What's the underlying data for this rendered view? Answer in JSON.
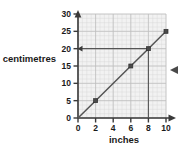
{
  "chart_data": {
    "type": "line",
    "title": "",
    "subtitle": "",
    "xlabel": "inches",
    "ylabel": "centimetres",
    "xlim": [
      0,
      10
    ],
    "ylim": [
      0,
      30
    ],
    "x_ticks": [
      0,
      2,
      4,
      6,
      8,
      10
    ],
    "y_ticks": [
      0,
      5,
      10,
      15,
      20,
      25,
      30
    ],
    "x_tick_labels": [
      "0",
      "2",
      "4",
      "6",
      "8",
      "10"
    ],
    "y_tick_labels": [
      "0",
      "5",
      "10",
      "15",
      "20",
      "25",
      "30"
    ],
    "grid": true,
    "grid_minor": true,
    "legend": "none",
    "series": [
      {
        "name": "inches to centimetres conversion",
        "x": [
          0,
          2,
          6,
          8,
          10
        ],
        "values": [
          0,
          5,
          15,
          20,
          25
        ],
        "marker_points": [
          {
            "x": 2,
            "y": 5
          },
          {
            "x": 6,
            "y": 15
          },
          {
            "x": 8,
            "y": 20
          },
          {
            "x": 10,
            "y": 25
          }
        ],
        "slope": 2.5
      }
    ],
    "annotations": [
      {
        "name": "vertical-construction-line",
        "from": {
          "x": 8,
          "y": 0
        },
        "to": {
          "x": 8,
          "y": 20
        },
        "arrow": false
      },
      {
        "name": "horizontal-construction-line",
        "from": {
          "x": 8,
          "y": 20
        },
        "to": {
          "x": 0,
          "y": 20
        },
        "arrow": true
      }
    ],
    "colors": {
      "series_line": "#555555",
      "marker": "#4a4a4a",
      "axis": "#3a3a3a",
      "grid_major": "#bdbdbd",
      "grid_minor": "#d6d6d6",
      "plot_background": "#f2f2f2",
      "page_background": "#ffffff",
      "text": "#1a1a1a"
    }
  },
  "labels": {
    "y_axis": "centimetres",
    "x_axis": "inches",
    "y_ticks": [
      "30",
      "25",
      "20",
      "15",
      "10",
      "5",
      "0"
    ],
    "x_ticks": [
      "0",
      "2",
      "4",
      "6",
      "8",
      "10"
    ]
  },
  "marks": {
    "right_pointer": "left-arrow-marker"
  }
}
